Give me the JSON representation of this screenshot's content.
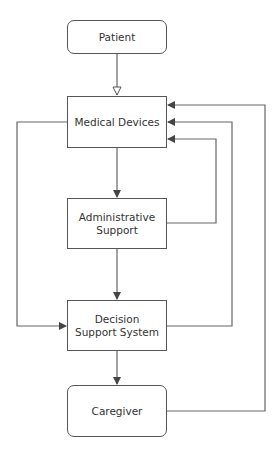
{
  "diagram": {
    "nodes": [
      {
        "id": "patient",
        "label": "Patient",
        "shape": "rounded"
      },
      {
        "id": "medical_devices",
        "label": "Medical Devices",
        "shape": "rect"
      },
      {
        "id": "administrative_support",
        "label": "Administrative Support",
        "shape": "rect"
      },
      {
        "id": "decision_support_system",
        "label": "Decision Support System",
        "shape": "rect"
      },
      {
        "id": "caregiver",
        "label": "Caregiver",
        "shape": "rounded"
      }
    ],
    "edges": [
      {
        "from": "patient",
        "to": "medical_devices",
        "arrow": "open-triangle"
      },
      {
        "from": "medical_devices",
        "to": "administrative_support",
        "arrow": "filled"
      },
      {
        "from": "administrative_support",
        "to": "decision_support_system",
        "arrow": "filled"
      },
      {
        "from": "decision_support_system",
        "to": "caregiver",
        "arrow": "filled"
      },
      {
        "from": "medical_devices",
        "to": "decision_support_system",
        "arrow": "filled",
        "route": "left"
      },
      {
        "from": "administrative_support",
        "to": "medical_devices",
        "arrow": "filled",
        "route": "right-inner"
      },
      {
        "from": "decision_support_system",
        "to": "medical_devices",
        "arrow": "filled",
        "route": "right-middle"
      },
      {
        "from": "caregiver",
        "to": "medical_devices",
        "arrow": "filled",
        "route": "right-outer"
      }
    ],
    "colors": {
      "line": "#555555",
      "text": "#333333",
      "background": "#ffffff"
    }
  },
  "labels": {
    "patient": "Patient",
    "medical_devices": "Medical Devices",
    "administrative_support": "Administrative Support",
    "decision_support_system": "Decision Support System",
    "caregiver": "Caregiver"
  }
}
